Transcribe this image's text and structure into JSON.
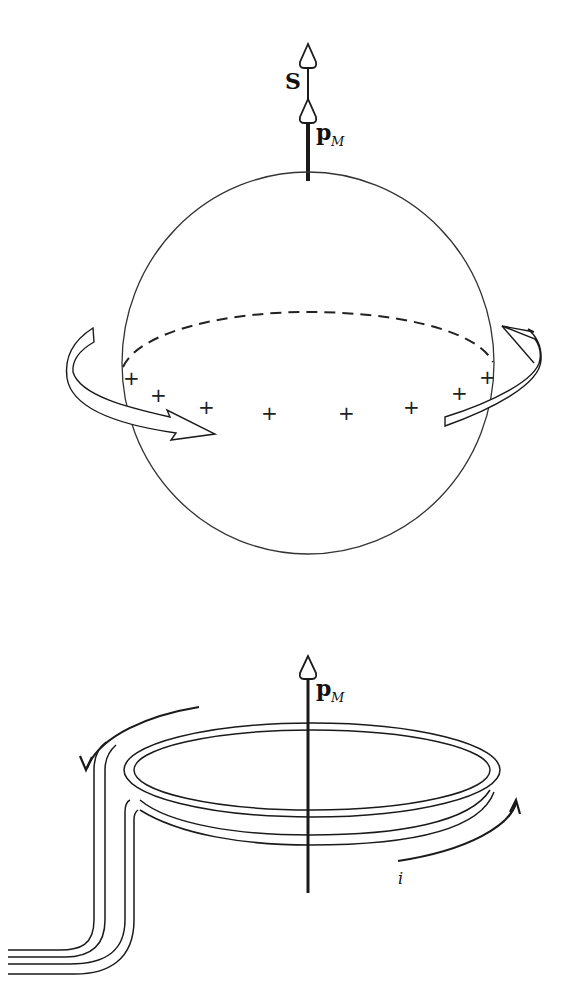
{
  "figure_top": {
    "description": "Spinning charged sphere with spin angular momentum and magnetic moment",
    "labels": {
      "spin": "S",
      "moment_main": "p",
      "moment_sub": "M"
    },
    "charges": [
      "+",
      "+",
      "+",
      "+",
      "+",
      "+",
      "+",
      "+",
      "+"
    ],
    "rotation_arrow": "counterclockwise band arrow around equator"
  },
  "figure_bottom": {
    "description": "Current loop with magnetic moment",
    "labels": {
      "moment_main": "p",
      "moment_sub": "M",
      "current": "i"
    },
    "arrows": [
      "current direction left (counterclockwise)",
      "current direction right (upward)"
    ]
  },
  "colors": {
    "ink": "#1a1a1a",
    "background": "#ffffff"
  }
}
